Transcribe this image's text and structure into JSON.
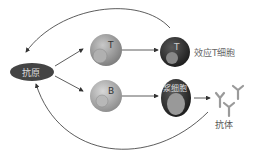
{
  "diagram": {
    "nodes": {
      "antigen": {
        "label": "抗原",
        "color": "#4a4a4a"
      },
      "t_cell": {
        "label": "T",
        "color": "#9a9a9a"
      },
      "b_cell": {
        "label": "B",
        "color": "#a8a8a8"
      },
      "effector_t": {
        "label": "T",
        "color": "#2e2e2e"
      },
      "plasma_cell": {
        "label": "浆细胞",
        "color": "#262626"
      },
      "antibody": {
        "label": "抗体"
      }
    },
    "labels": {
      "effector_t_caption": "效应T细胞",
      "antibody_caption": "抗体"
    }
  }
}
